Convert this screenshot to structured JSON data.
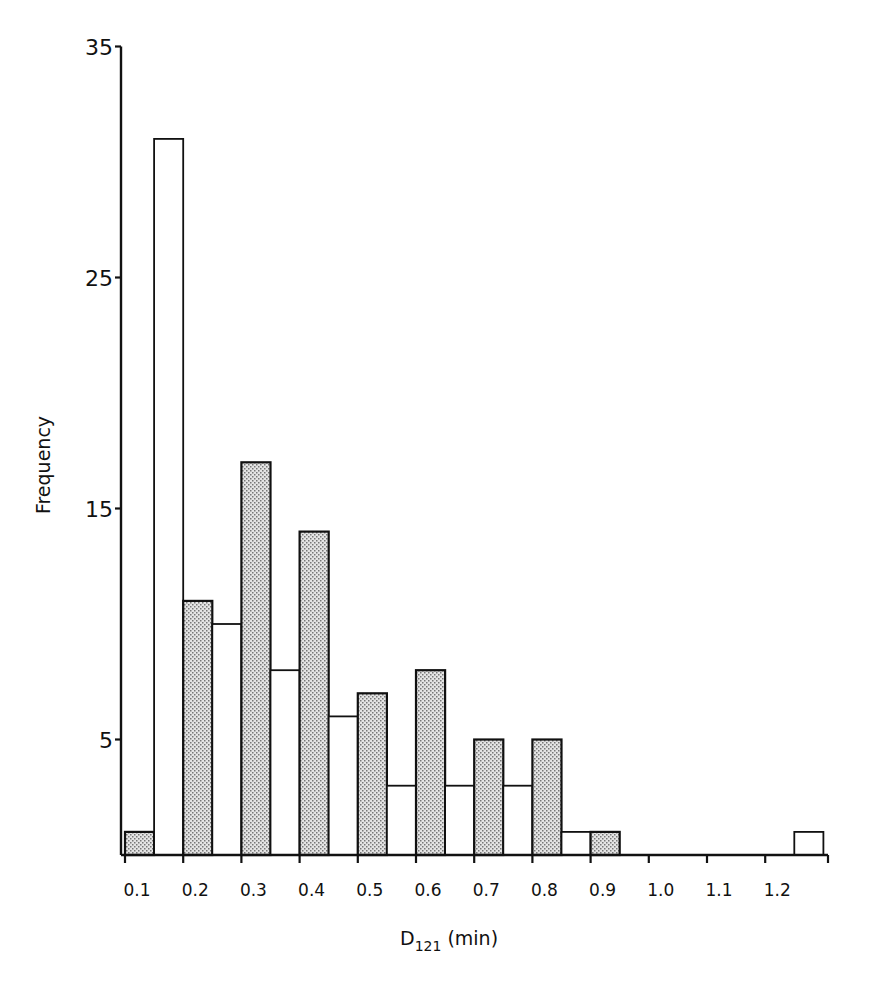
{
  "chart_data": {
    "type": "bar",
    "title": "",
    "xlabel": "D121 (min)",
    "xlabel_main": "D",
    "xlabel_sub": "121",
    "xlabel_unit": " (min)",
    "ylabel": "Frequency",
    "ylim": [
      0,
      35
    ],
    "yticks": [
      5,
      15,
      25,
      35
    ],
    "grid": false,
    "legend": "none",
    "categories": [
      "0.1",
      "0.2",
      "0.3",
      "0.4",
      "0.5",
      "0.6",
      "0.7",
      "0.8",
      "0.9",
      "1.0",
      "1.1",
      "1.2"
    ],
    "series": [
      {
        "name": "shaded",
        "fill": "stippled-grey",
        "values": [
          1,
          11,
          17,
          14,
          7,
          8,
          5,
          5,
          1,
          0,
          0,
          0
        ]
      },
      {
        "name": "open",
        "fill": "white",
        "values": [
          31,
          10,
          8,
          6,
          3,
          3,
          3,
          1,
          0,
          0,
          0,
          1
        ]
      }
    ]
  },
  "colors": {
    "stroke": "#111111",
    "shade": "#c9c9c9",
    "background": "#ffffff"
  }
}
